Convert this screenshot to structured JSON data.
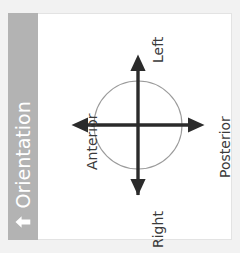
{
  "panel": {
    "background_color": "#ffffff",
    "border_color": "#e3e3e3"
  },
  "sidebar": {
    "title": "Orientation",
    "icon": "up-arrow-icon",
    "background_color": "#b3b3b3",
    "text_color": "#ffffff"
  },
  "diagram": {
    "type": "orientation-crosshair",
    "circle": {
      "center_x": 100,
      "center_y": 112,
      "radius": 44,
      "stroke_color": "#9e9e9e",
      "stroke_width": 1
    },
    "axis_color": "#2b2b2b",
    "labels": {
      "top": "Left",
      "bottom": "Right",
      "left": "Anterior",
      "right": "Posterior"
    },
    "axes": [
      {
        "name": "vertical-axis",
        "from": "Right",
        "to": "Left",
        "orientation": "vertical"
      },
      {
        "name": "horizontal-axis",
        "from": "Anterior",
        "to": "Posterior",
        "orientation": "horizontal"
      }
    ]
  }
}
